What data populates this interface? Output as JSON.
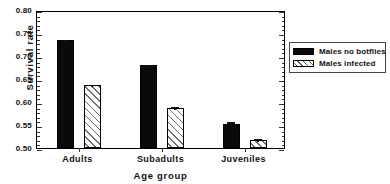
{
  "chart_data": {
    "type": "bar",
    "title": "",
    "xlabel": "Age group",
    "ylabel": "Survival rate",
    "categories": [
      "Adults",
      "Subadults",
      "Juveniles"
    ],
    "series": [
      {
        "name": "Males no botflies",
        "fill": "solid-black",
        "values": [
          0.735,
          0.68,
          0.553
        ],
        "errors": [
          0.005,
          0.004,
          0.007
        ]
      },
      {
        "name": "Males infected",
        "fill": "diagonal-hatch",
        "values": [
          0.636,
          0.588,
          0.518
        ],
        "errors": [
          0.006,
          0.005,
          0.006
        ]
      }
    ],
    "ylim": [
      0.5,
      0.8
    ],
    "ytick_values": [
      0.8,
      0.75,
      0.7,
      0.65,
      0.6,
      0.55,
      0.5
    ],
    "ytick_labels": [
      "0.80",
      "0.75",
      "0.70",
      "0.65",
      "0.60",
      "0.55",
      "0.50"
    ],
    "minor_ticks_per_interval": 5,
    "grid": false,
    "legend_position": "right-outside",
    "legend_entries": [
      "Males no botflies",
      "Males infected"
    ],
    "colors": {
      "series1": "#0a0a0a",
      "series2_hatch": "#6e6e6e",
      "series2_background": "#c9c9c9",
      "axis": "#000000",
      "text": "#111111",
      "background": "#ffffff"
    }
  },
  "figure": {
    "cropped_title": "",
    "axis_title_x": "Age group",
    "axis_title_y": "Survival rate"
  }
}
